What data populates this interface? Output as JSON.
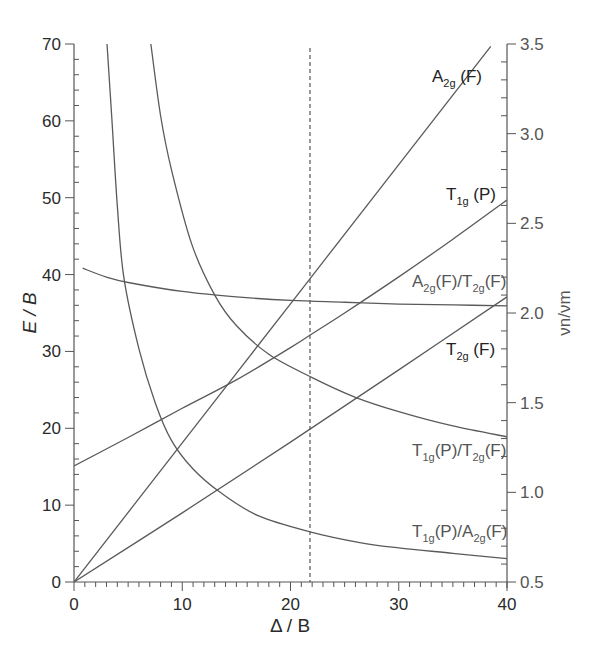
{
  "chart_data": {
    "type": "line",
    "title": "",
    "xlabel": "Δ / B",
    "ylabel": "E / B",
    "y2label": "νn/νm",
    "xlim": [
      0,
      40
    ],
    "ylim": [
      0,
      70
    ],
    "y2lim": [
      0.5,
      3.5
    ],
    "grid": false,
    "legend": "inline labels at right edge",
    "x_ticks": [
      "0",
      "10",
      "20",
      "30",
      "40"
    ],
    "y_ticks": [
      "0",
      "10",
      "20",
      "30",
      "40",
      "50",
      "60",
      "70"
    ],
    "y2_ticks": [
      "0.5",
      "1.0",
      "1.5",
      "2.0",
      "2.5",
      "3.0",
      "3.5"
    ],
    "vertical_reference_line": {
      "x": 21.8,
      "style": "dashed"
    },
    "series": [
      {
        "name": "A2g (F)",
        "axis": "left",
        "label_parts": [
          "A",
          "2g",
          " (F)"
        ],
        "x": [
          0,
          10,
          20,
          30,
          38.5
        ],
        "y": [
          0,
          18.1,
          36.2,
          54.3,
          69.7
        ]
      },
      {
        "name": "T1g (P)",
        "axis": "left",
        "label_parts": [
          "T",
          "1g",
          " (P)"
        ],
        "x": [
          0,
          5,
          10,
          15,
          20,
          22,
          25,
          30,
          35,
          40
        ],
        "y": [
          15.1,
          18.8,
          22.6,
          26.3,
          30.5,
          32.3,
          35.0,
          39.7,
          44.6,
          49.7
        ]
      },
      {
        "name": "T2g (F)",
        "axis": "left",
        "label_parts": [
          "T",
          "2g",
          " (F)"
        ],
        "x": [
          0,
          10,
          20,
          30,
          40
        ],
        "y": [
          0,
          9.0,
          18.2,
          27.6,
          37.1
        ]
      },
      {
        "name": "A2g(F)/T2g(F)",
        "axis": "right",
        "label_parts": [
          "A",
          "2g",
          "(F)/T",
          "2g",
          "(F)"
        ],
        "x": [
          0.8,
          3,
          5,
          10,
          15,
          20,
          25,
          30,
          35,
          40
        ],
        "y": [
          2.25,
          2.2,
          2.17,
          2.12,
          2.09,
          2.07,
          2.06,
          2.05,
          2.045,
          2.04
        ]
      },
      {
        "name": "T1g(P)/T2g(F)",
        "axis": "right",
        "label_parts": [
          "T",
          "1g",
          "(P)/T",
          "2g",
          "(F)"
        ],
        "x": [
          7.1,
          8,
          9,
          10.9,
          13,
          15,
          18,
          22,
          26,
          30,
          35,
          40
        ],
        "y": [
          3.5,
          3.1,
          2.8,
          2.38,
          2.1,
          1.93,
          1.77,
          1.64,
          1.53,
          1.45,
          1.37,
          1.31
        ]
      },
      {
        "name": "T1g(P)/A2g(F)",
        "axis": "right",
        "label_parts": [
          "T",
          "1g",
          "(P)/A",
          "2g",
          "(F)"
        ],
        "x": [
          3.05,
          3.5,
          4,
          4.6,
          6,
          7.5,
          9,
          11,
          13.5,
          17,
          21.8,
          26.4,
          30,
          35,
          40
        ],
        "y": [
          3.5,
          3.08,
          2.6,
          2.2,
          1.8,
          1.5,
          1.29,
          1.13,
          1.0,
          0.87,
          0.78,
          0.72,
          0.69,
          0.66,
          0.63
        ]
      }
    ]
  }
}
